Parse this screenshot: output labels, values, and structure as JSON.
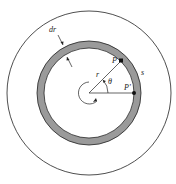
{
  "diagram": {
    "labels": {
      "dr": "dr",
      "P": "P",
      "P_prime": "P'",
      "r": "r",
      "theta": "θ",
      "s": "s"
    },
    "colors": {
      "ring_fill": "#9a9a9a",
      "stroke": "#222222",
      "background": "#ffffff"
    },
    "geometry": {
      "center": [
        89,
        93
      ],
      "outer_circle_radius": 82,
      "ring_outer_radius": 52,
      "ring_inner_radius": 45,
      "small_circle_radius": 11,
      "angle_theta_deg": 40
    }
  }
}
